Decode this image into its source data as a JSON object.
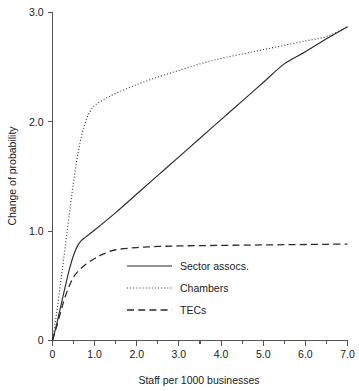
{
  "chart_data": {
    "type": "line",
    "title": "",
    "xlabel": "Staff per 1000 businesses",
    "ylabel": "Change of probability",
    "xlim": [
      0,
      7.0
    ],
    "ylim": [
      0,
      3.0
    ],
    "grid": false,
    "legend_position": "center",
    "x_ticks": [
      "0",
      "1.0",
      "2.0",
      "3.0",
      "4.0",
      "5.0",
      "6.0",
      "7.0"
    ],
    "x_tick_values": [
      0,
      1.0,
      2.0,
      3.0,
      4.0,
      5.0,
      6.0,
      7.0
    ],
    "x_minor_tick_values": [
      0.5,
      1.5,
      2.5,
      3.5,
      4.5,
      5.5,
      6.5
    ],
    "y_ticks": [
      "0",
      "1.0",
      "2.0",
      "3.0"
    ],
    "y_tick_values": [
      0,
      1.0,
      2.0,
      3.0
    ],
    "series": [
      {
        "name": "Sector assocs.",
        "style": "solid",
        "color": "#2b2b2b",
        "x": [
          0,
          0.1,
          0.2,
          0.3,
          0.4,
          0.5,
          0.6,
          0.7,
          0.8,
          1.0,
          1.5,
          2.0,
          2.5,
          3.0,
          3.5,
          4.0,
          4.5,
          5.0,
          5.5,
          6.0,
          6.5,
          7.0
        ],
        "y": [
          0,
          0.15,
          0.32,
          0.49,
          0.65,
          0.78,
          0.87,
          0.92,
          0.95,
          1.01,
          1.17,
          1.34,
          1.51,
          1.68,
          1.85,
          2.02,
          2.19,
          2.36,
          2.53,
          2.64,
          2.76,
          2.87
        ]
      },
      {
        "name": "Chambers",
        "style": "dotted",
        "color": "#3a3a3a",
        "x": [
          0,
          0.1,
          0.2,
          0.3,
          0.4,
          0.5,
          0.6,
          0.7,
          0.8,
          0.9,
          1.0,
          1.2,
          1.5,
          2.0,
          2.5,
          3.0,
          3.5,
          4.0,
          4.5,
          5.0,
          5.5,
          6.0,
          6.5,
          7.0
        ],
        "y": [
          0,
          0.26,
          0.55,
          0.85,
          1.16,
          1.45,
          1.7,
          1.89,
          2.02,
          2.1,
          2.15,
          2.2,
          2.26,
          2.34,
          2.41,
          2.47,
          2.53,
          2.58,
          2.62,
          2.66,
          2.7,
          2.74,
          2.78,
          2.87
        ]
      },
      {
        "name": "TECs",
        "style": "dashed",
        "color": "#2b2b2b",
        "x": [
          0,
          0.1,
          0.2,
          0.3,
          0.4,
          0.5,
          0.6,
          0.8,
          1.0,
          1.2,
          1.5,
          2.0,
          2.5,
          3.0,
          3.5,
          4.0,
          4.5,
          5.0,
          5.5,
          6.0,
          6.5,
          7.0
        ],
        "y": [
          0,
          0.13,
          0.27,
          0.4,
          0.5,
          0.58,
          0.63,
          0.7,
          0.75,
          0.79,
          0.83,
          0.85,
          0.86,
          0.865,
          0.868,
          0.87,
          0.872,
          0.874,
          0.876,
          0.878,
          0.88,
          0.882
        ]
      }
    ]
  },
  "legend": {
    "items": [
      {
        "label": "Sector assocs.",
        "style": "solid"
      },
      {
        "label": "Chambers",
        "style": "dotted"
      },
      {
        "label": "TECs",
        "style": "dashed"
      }
    ]
  },
  "colors": {
    "axis": "#555555",
    "ink": "#1a1a1a",
    "background": "#ffffff"
  }
}
